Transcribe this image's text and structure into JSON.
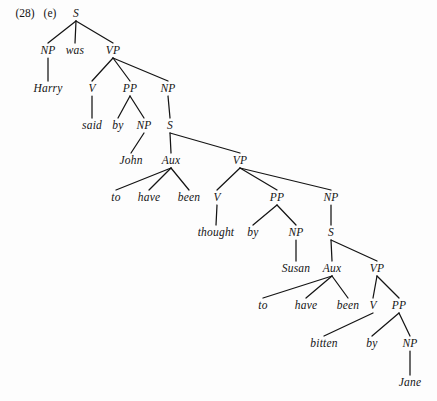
{
  "page": {
    "width": 437,
    "height": 401,
    "background": "#fdfdfd",
    "ink": "#141414"
  },
  "example": {
    "number": "(28)",
    "sublabel": "(e)"
  },
  "diagram": {
    "type": "syntax-tree",
    "sentence": "Harry was said by John to have been thought by Susan to have been bitten by Jane",
    "nodes": [
      {
        "id": "S1",
        "label": "S",
        "x": 76,
        "y": 14,
        "kind": "category"
      },
      {
        "id": "NP1",
        "label": "NP",
        "x": 48,
        "y": 51,
        "kind": "category"
      },
      {
        "id": "was",
        "label": "was",
        "x": 75,
        "y": 51,
        "kind": "terminal"
      },
      {
        "id": "VP1",
        "label": "VP",
        "x": 113,
        "y": 51,
        "kind": "category"
      },
      {
        "id": "Harry",
        "label": "Harry",
        "x": 48,
        "y": 89,
        "kind": "terminal"
      },
      {
        "id": "V1",
        "label": "V",
        "x": 92,
        "y": 89,
        "kind": "category"
      },
      {
        "id": "PP1",
        "label": "PP",
        "x": 130,
        "y": 89,
        "kind": "category"
      },
      {
        "id": "NP2",
        "label": "NP",
        "x": 168,
        "y": 89,
        "kind": "category"
      },
      {
        "id": "said",
        "label": "said",
        "x": 92,
        "y": 126,
        "kind": "terminal"
      },
      {
        "id": "by1",
        "label": "by",
        "x": 118,
        "y": 126,
        "kind": "terminal"
      },
      {
        "id": "NP3",
        "label": "NP",
        "x": 144,
        "y": 126,
        "kind": "category"
      },
      {
        "id": "S2",
        "label": "S",
        "x": 170,
        "y": 126,
        "kind": "category"
      },
      {
        "id": "John",
        "label": "John",
        "x": 131,
        "y": 161,
        "kind": "terminal"
      },
      {
        "id": "Aux1",
        "label": "Aux",
        "x": 171,
        "y": 161,
        "kind": "category"
      },
      {
        "id": "VP2",
        "label": "VP",
        "x": 240,
        "y": 161,
        "kind": "category"
      },
      {
        "id": "to1",
        "label": "to",
        "x": 116,
        "y": 198,
        "kind": "terminal"
      },
      {
        "id": "have1",
        "label": "have",
        "x": 149,
        "y": 198,
        "kind": "terminal"
      },
      {
        "id": "been1",
        "label": "been",
        "x": 189,
        "y": 198,
        "kind": "terminal"
      },
      {
        "id": "V2",
        "label": "V",
        "x": 217,
        "y": 198,
        "kind": "category"
      },
      {
        "id": "PP2",
        "label": "PP",
        "x": 277,
        "y": 198,
        "kind": "category"
      },
      {
        "id": "NP4",
        "label": "NP",
        "x": 331,
        "y": 198,
        "kind": "category"
      },
      {
        "id": "thought",
        "label": "thought",
        "x": 216,
        "y": 233,
        "kind": "terminal"
      },
      {
        "id": "by2",
        "label": "by",
        "x": 253,
        "y": 233,
        "kind": "terminal"
      },
      {
        "id": "NP5",
        "label": "NP",
        "x": 296,
        "y": 233,
        "kind": "category"
      },
      {
        "id": "S3",
        "label": "S",
        "x": 331,
        "y": 233,
        "kind": "category"
      },
      {
        "id": "Susan",
        "label": "Susan",
        "x": 296,
        "y": 269,
        "kind": "terminal"
      },
      {
        "id": "Aux2",
        "label": "Aux",
        "x": 332,
        "y": 269,
        "kind": "category"
      },
      {
        "id": "VP3",
        "label": "VP",
        "x": 377,
        "y": 269,
        "kind": "category"
      },
      {
        "id": "to2",
        "label": "to",
        "x": 263,
        "y": 306,
        "kind": "terminal"
      },
      {
        "id": "have2",
        "label": "have",
        "x": 306,
        "y": 306,
        "kind": "terminal"
      },
      {
        "id": "been2",
        "label": "been",
        "x": 348,
        "y": 306,
        "kind": "terminal"
      },
      {
        "id": "V3",
        "label": "V",
        "x": 373,
        "y": 306,
        "kind": "category"
      },
      {
        "id": "PP3",
        "label": "PP",
        "x": 399,
        "y": 306,
        "kind": "category"
      },
      {
        "id": "bitten",
        "label": "bitten",
        "x": 324,
        "y": 344,
        "kind": "terminal"
      },
      {
        "id": "by3",
        "label": "by",
        "x": 372,
        "y": 344,
        "kind": "terminal"
      },
      {
        "id": "NP6",
        "label": "NP",
        "x": 410,
        "y": 344,
        "kind": "category"
      },
      {
        "id": "Jane",
        "label": "Jane",
        "x": 410,
        "y": 383,
        "kind": "terminal"
      }
    ],
    "edges": [
      {
        "from": "S1",
        "to": "NP1"
      },
      {
        "from": "S1",
        "to": "was"
      },
      {
        "from": "S1",
        "to": "VP1"
      },
      {
        "from": "NP1",
        "to": "Harry"
      },
      {
        "from": "VP1",
        "to": "V1"
      },
      {
        "from": "VP1",
        "to": "PP1"
      },
      {
        "from": "VP1",
        "to": "NP2"
      },
      {
        "from": "V1",
        "to": "said"
      },
      {
        "from": "PP1",
        "to": "by1"
      },
      {
        "from": "PP1",
        "to": "NP3"
      },
      {
        "from": "NP2",
        "to": "S2"
      },
      {
        "from": "NP3",
        "to": "John"
      },
      {
        "from": "S2",
        "to": "Aux1"
      },
      {
        "from": "S2",
        "to": "VP2"
      },
      {
        "from": "Aux1",
        "to": "to1"
      },
      {
        "from": "Aux1",
        "to": "have1"
      },
      {
        "from": "Aux1",
        "to": "been1"
      },
      {
        "from": "VP2",
        "to": "V2"
      },
      {
        "from": "VP2",
        "to": "PP2"
      },
      {
        "from": "VP2",
        "to": "NP4"
      },
      {
        "from": "V2",
        "to": "thought"
      },
      {
        "from": "PP2",
        "to": "by2"
      },
      {
        "from": "PP2",
        "to": "NP5"
      },
      {
        "from": "NP4",
        "to": "S3"
      },
      {
        "from": "NP5",
        "to": "Susan"
      },
      {
        "from": "S3",
        "to": "Aux2"
      },
      {
        "from": "S3",
        "to": "VP3"
      },
      {
        "from": "Aux2",
        "to": "to2"
      },
      {
        "from": "Aux2",
        "to": "have2"
      },
      {
        "from": "Aux2",
        "to": "been2"
      },
      {
        "from": "VP3",
        "to": "V3"
      },
      {
        "from": "VP3",
        "to": "PP3"
      },
      {
        "from": "V3",
        "to": "bitten"
      },
      {
        "from": "PP3",
        "to": "by3"
      },
      {
        "from": "PP3",
        "to": "NP6"
      },
      {
        "from": "NP6",
        "to": "Jane"
      }
    ]
  }
}
